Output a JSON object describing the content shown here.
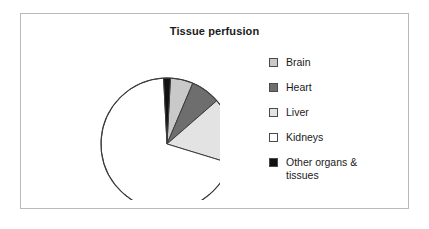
{
  "chart": {
    "title": "Tissue perfusion",
    "frame_border_color": "#b9b9b9"
  },
  "legend": {
    "items": [
      {
        "label": "Brain",
        "color": "#c9c9c9",
        "swatch_name": "legend-swatch-brain"
      },
      {
        "label": "Heart",
        "color": "#6e6e6e",
        "swatch_name": "legend-swatch-heart"
      },
      {
        "label": "Liver",
        "color": "#e3e3e3",
        "swatch_name": "legend-swatch-liver"
      },
      {
        "label": "Kidneys",
        "color": "#ffffff",
        "swatch_name": "legend-swatch-kidneys"
      },
      {
        "label": "Other organs &\ntissues",
        "color": "#111111",
        "swatch_name": "legend-swatch-other"
      }
    ]
  },
  "chart_data": {
    "type": "pie",
    "title": "Tissue perfusion",
    "labels": [
      "Brain",
      "Heart",
      "Liver",
      "Kidneys",
      "Other organs & tissues"
    ],
    "values": [
      20,
      26,
      58,
      250,
      6
    ],
    "value_unit": "degrees",
    "percentages": [
      5.6,
      7.2,
      16.1,
      69.4,
      1.7
    ],
    "colors": [
      "#c9c9c9",
      "#6e6e6e",
      "#e3e3e3",
      "#ffffff",
      "#111111"
    ],
    "start_angle_deg": 3,
    "direction": "clockwise",
    "legend_position": "right",
    "grid": false,
    "xlabel": "",
    "ylabel": ""
  }
}
